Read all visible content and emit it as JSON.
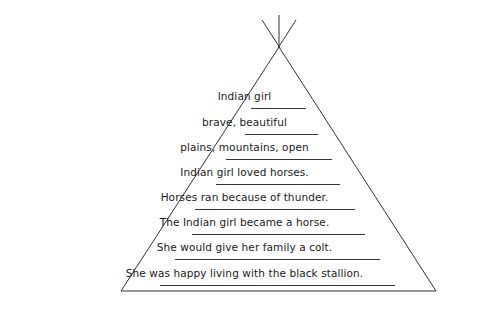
{
  "worksheet": {
    "shape": "tipi",
    "lines": [
      {
        "text": "Indian girl",
        "y": 96
      },
      {
        "text": "brave, beautiful",
        "y": 122
      },
      {
        "text": "plains, mountains, open",
        "y": 147
      },
      {
        "text": "Indian girl loved horses.",
        "y": 172
      },
      {
        "text": "Horses ran because of thunder.",
        "y": 197
      },
      {
        "text": "The Indian girl became a horse.",
        "y": 222
      },
      {
        "text": "She would give her family a colt.",
        "y": 247
      },
      {
        "text": "She was happy living with the black stallion.",
        "y": 273
      }
    ],
    "underlines": [
      {
        "x1": 251,
        "x2": 306,
        "y": 108
      },
      {
        "x1": 245,
        "x2": 318,
        "y": 134
      },
      {
        "x1": 226,
        "x2": 332,
        "y": 159
      },
      {
        "x1": 216,
        "x2": 340,
        "y": 184
      },
      {
        "x1": 195,
        "x2": 355,
        "y": 209
      },
      {
        "x1": 192,
        "x2": 365,
        "y": 234
      },
      {
        "x1": 175,
        "x2": 380,
        "y": 259
      },
      {
        "x1": 160,
        "x2": 395,
        "y": 285
      }
    ],
    "colors": {
      "ink": "#1a1a1a",
      "paper": "#ffffff"
    }
  }
}
